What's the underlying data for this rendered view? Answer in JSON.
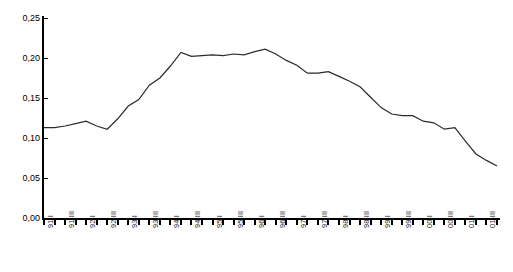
{
  "chart_data": {
    "type": "line",
    "title": "",
    "subtitle": "",
    "xlabel": "",
    "ylabel": "",
    "ylim": [
      0.0,
      0.25
    ],
    "ytick_labels": [
      "0,25",
      "0,20",
      "0,15",
      "0,10",
      "0,05",
      "0,00"
    ],
    "ytick_values": [
      0.25,
      0.2,
      0.15,
      0.1,
      0.05,
      0.0
    ],
    "grid": false,
    "legend": null,
    "decimal_separator": ",",
    "x_tick_count": 44,
    "x_labeled_tick_interval": 2,
    "x_tick_labels": [
      "91-I",
      "91-III",
      "92-I",
      "92-III",
      "93-I",
      "93-III",
      "94-I",
      "94-III",
      "95-I",
      "95-III",
      "96-I",
      "96-III",
      "97-I",
      "97-III",
      "98-I",
      "98-III",
      "99-I",
      "99-III",
      "00-I",
      "00-III",
      "01-I",
      "01-III"
    ],
    "x": [
      "91-I",
      "91-II",
      "91-III",
      "91-IV",
      "92-I",
      "92-II",
      "92-III",
      "92-IV",
      "93-I",
      "93-II",
      "93-III",
      "93-IV",
      "94-I",
      "94-II",
      "94-III",
      "94-IV",
      "95-I",
      "95-II",
      "95-III",
      "95-IV",
      "96-I",
      "96-II",
      "96-III",
      "96-IV",
      "97-I",
      "97-II",
      "97-III",
      "97-IV",
      "98-I",
      "98-II",
      "98-III",
      "98-IV",
      "99-I",
      "99-II",
      "99-III",
      "99-IV",
      "00-I",
      "00-II",
      "00-III",
      "00-IV",
      "01-I",
      "01-II",
      "01-III",
      "01-IV"
    ],
    "values": [
      0.113,
      0.113,
      0.115,
      0.118,
      0.121,
      0.115,
      0.111,
      0.124,
      0.14,
      0.148,
      0.166,
      0.175,
      0.19,
      0.207,
      0.202,
      0.203,
      0.204,
      0.203,
      0.205,
      0.204,
      0.208,
      0.211,
      0.205,
      0.197,
      0.191,
      0.181,
      0.181,
      0.183,
      0.177,
      0.171,
      0.164,
      0.151,
      0.138,
      0.13,
      0.128,
      0.128,
      0.121,
      0.119,
      0.111,
      0.113,
      0.096,
      0.08,
      0.072,
      0.065
    ],
    "series_color": "#2b2b2b",
    "axis_color": "#000000",
    "background_color": "#ffffff"
  }
}
